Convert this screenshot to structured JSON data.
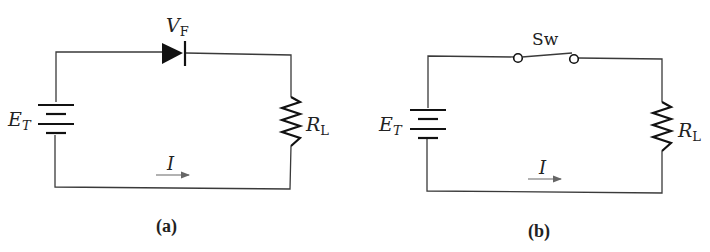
{
  "figure": {
    "panels": [
      {
        "id": "a",
        "caption": "(a)",
        "source_label": "E",
        "source_sub": "T",
        "element_label": "V",
        "element_sub": "F",
        "element_type": "diode",
        "load_label": "R",
        "load_sub": "L",
        "current_label": "I"
      },
      {
        "id": "b",
        "caption": "(b)",
        "source_label": "E",
        "source_sub": "T",
        "element_label": "Sw",
        "element_type": "switch",
        "load_label": "R",
        "load_sub": "L",
        "current_label": "I"
      }
    ],
    "colors": {
      "wire": "#3a3a3a",
      "component": "#111111",
      "arrow": "#666666",
      "background": "#ffffff"
    }
  }
}
